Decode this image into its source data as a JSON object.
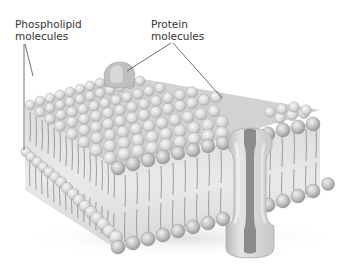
{
  "labels": {
    "phospholipid": {
      "line1": "Phospholipid",
      "line2": "molecules"
    },
    "protein": {
      "line1": "Protein",
      "line2": "molecules"
    }
  },
  "colors": {
    "head_fill": "#c4c4c4",
    "head_highlight": "#e6e6e6",
    "head_shadow": "#9a9a9a",
    "tail_stroke": "#8a8a8a",
    "core_fill": "#e2e2e2",
    "protein_outer": "#d4d4d4",
    "protein_channel": "#8c8c8c",
    "leader_line": "#333333"
  }
}
